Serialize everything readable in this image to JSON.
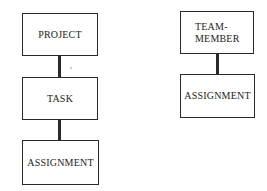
{
  "diagram": {
    "left_hierarchy": {
      "entities": [
        {
          "label": "PROJECT"
        },
        {
          "label": "TASK"
        },
        {
          "label": "ASSIGNMENT"
        }
      ]
    },
    "right_hierarchy": {
      "entities": [
        {
          "label": "TEAM-\nMEMBER"
        },
        {
          "label": "ASSIGNMENT"
        }
      ]
    },
    "colors": {
      "stroke": "#2a2a2a",
      "background": "#ffffff"
    }
  }
}
